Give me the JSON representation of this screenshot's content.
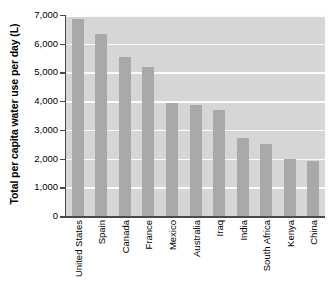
{
  "chart_data": {
    "type": "bar",
    "title": "",
    "subtitle": "",
    "xlabel": "",
    "ylabel": "Total per capita water use per day (L)",
    "categories": [
      "United States",
      "Spain",
      "Canada",
      "France",
      "Mexico",
      "Australia",
      "Iraq",
      "India",
      "South Africa",
      "Kenya",
      "China"
    ],
    "values": [
      6850,
      6350,
      5550,
      5200,
      3950,
      3850,
      3700,
      2700,
      2500,
      2000,
      1900
    ],
    "ylim": [
      0,
      7000
    ],
    "ytick_labels": [
      "0",
      "1,000",
      "2,000",
      "3,000",
      "4,000",
      "5,000",
      "6,000",
      "7,000"
    ],
    "ytick_values": [
      0,
      1000,
      2000,
      3000,
      4000,
      5000,
      6000,
      7000
    ],
    "grid": true,
    "legend": "none",
    "bar_color": "#a9a9a9",
    "plot_background_color": "#d6d6d6",
    "gridline_color": "#fbfbfb",
    "axis_color": "#4a4a4a"
  }
}
